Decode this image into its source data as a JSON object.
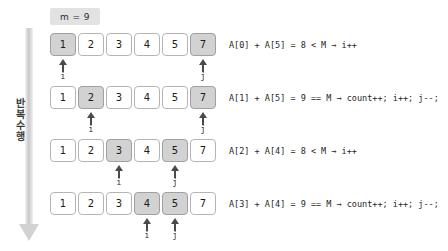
{
  "badge": {
    "label": "m = 9"
  },
  "loop": {
    "label": "반복 수행",
    "arrow_icon": "down-arrow-icon"
  },
  "rows": [
    {
      "values": [
        "1",
        "2",
        "3",
        "4",
        "5",
        "7"
      ],
      "highlighted": [
        0,
        5
      ],
      "pointers": [
        {
          "label": "i",
          "index": 0
        },
        {
          "label": "j",
          "index": 5
        }
      ],
      "expression": "A[0] + A[5] = 8 < M  → i++"
    },
    {
      "values": [
        "1",
        "2",
        "3",
        "4",
        "5",
        "7"
      ],
      "highlighted": [
        1,
        5
      ],
      "pointers": [
        {
          "label": "i",
          "index": 1
        },
        {
          "label": "j",
          "index": 5
        }
      ],
      "expression": "A[1] + A[5] = 9 == M  → count++; i++; j--;"
    },
    {
      "values": [
        "1",
        "2",
        "3",
        "4",
        "5",
        "7"
      ],
      "highlighted": [
        2,
        4
      ],
      "pointers": [
        {
          "label": "i",
          "index": 2
        },
        {
          "label": "j",
          "index": 4
        }
      ],
      "expression": "A[2] + A[4] = 8 < M  → i++"
    },
    {
      "values": [
        "1",
        "2",
        "3",
        "4",
        "5",
        "7"
      ],
      "highlighted": [
        3,
        4
      ],
      "pointers": [
        {
          "label": "i",
          "index": 3
        },
        {
          "label": "j",
          "index": 4
        }
      ],
      "expression": "A[3] + A[4] = 9 == M  → count++; i++; j--;"
    }
  ],
  "colors": {
    "background": "#ffffff",
    "cell_border": "#b4b4b4",
    "cell_highlight": "#d2d2d2",
    "badge_background": "#e2e2e2",
    "pointer": "#4a4a4a",
    "loop_arrow": "#d2d2d2"
  },
  "layout": {
    "row_tops": [
      33,
      86,
      139,
      192
    ],
    "cell_width": 26,
    "cell_gap": 2,
    "row_left": 50
  }
}
